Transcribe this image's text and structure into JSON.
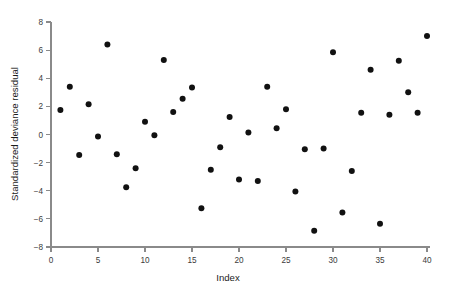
{
  "chart_data": {
    "type": "scatter",
    "title": "",
    "xlabel": "Index",
    "ylabel": "Standardized deviance residual",
    "xlim": [
      0,
      40
    ],
    "ylim": [
      -8,
      8
    ],
    "xticks": [
      0,
      5,
      10,
      15,
      20,
      25,
      30,
      35,
      40
    ],
    "xticklabels": [
      "0",
      "5",
      "10",
      "15",
      "20",
      "25",
      "30",
      "35",
      "40"
    ],
    "yticks": [
      -8,
      -6,
      -4,
      -2,
      0,
      2,
      4,
      6,
      8
    ],
    "yticklabels": [
      "-8",
      "-6",
      "-4",
      "-2",
      "0",
      "2",
      "4",
      "6",
      "8"
    ],
    "grid": false,
    "legend": null,
    "marker": "filled-circle",
    "marker_color": "#111111",
    "marker_size": 3.0,
    "x": [
      1,
      2,
      3,
      4,
      5,
      6,
      7,
      8,
      9,
      10,
      11,
      12,
      13,
      14,
      15,
      16,
      17,
      18,
      19,
      20,
      21,
      22,
      23,
      24,
      25,
      26,
      27,
      28,
      29,
      30,
      31,
      32,
      33,
      34,
      35,
      36,
      37,
      38,
      39,
      40
    ],
    "y": [
      1.75,
      3.4,
      -1.45,
      2.15,
      -0.15,
      6.4,
      -1.4,
      -3.75,
      -2.4,
      0.9,
      -0.05,
      5.3,
      1.6,
      2.55,
      3.35,
      -5.25,
      -2.5,
      -0.9,
      1.25,
      -3.2,
      0.15,
      -3.3,
      3.4,
      0.45,
      1.8,
      -4.05,
      -1.05,
      -6.85,
      -1.0,
      5.85,
      -5.55,
      -2.6,
      1.55,
      4.6,
      -6.35,
      1.4,
      5.25,
      3.0,
      1.55,
      7.0
    ],
    "points": [
      {
        "index": 1,
        "residual": 1.75
      },
      {
        "index": 2,
        "residual": 3.4
      },
      {
        "index": 3,
        "residual": -1.45
      },
      {
        "index": 4,
        "residual": 2.15
      },
      {
        "index": 5,
        "residual": -0.15
      },
      {
        "index": 6,
        "residual": 6.4
      },
      {
        "index": 7,
        "residual": -1.4
      },
      {
        "index": 8,
        "residual": -3.75
      },
      {
        "index": 9,
        "residual": -2.4
      },
      {
        "index": 10,
        "residual": 0.9
      },
      {
        "index": 11,
        "residual": -0.05
      },
      {
        "index": 12,
        "residual": 5.3
      },
      {
        "index": 13,
        "residual": 1.6
      },
      {
        "index": 14,
        "residual": 2.55
      },
      {
        "index": 15,
        "residual": 3.35
      },
      {
        "index": 16,
        "residual": -5.25
      },
      {
        "index": 17,
        "residual": -2.5
      },
      {
        "index": 18,
        "residual": -0.9
      },
      {
        "index": 19,
        "residual": 1.25
      },
      {
        "index": 20,
        "residual": -3.2
      },
      {
        "index": 21,
        "residual": 0.15
      },
      {
        "index": 22,
        "residual": -3.3
      },
      {
        "index": 23,
        "residual": 3.4
      },
      {
        "index": 24,
        "residual": 0.45
      },
      {
        "index": 25,
        "residual": 1.8
      },
      {
        "index": 26,
        "residual": -4.05
      },
      {
        "index": 27,
        "residual": -1.05
      },
      {
        "index": 28,
        "residual": -6.85
      },
      {
        "index": 29,
        "residual": -1.0
      },
      {
        "index": 30,
        "residual": 5.85
      },
      {
        "index": 31,
        "residual": -5.55
      },
      {
        "index": 32,
        "residual": -2.6
      },
      {
        "index": 33,
        "residual": 1.55
      },
      {
        "index": 34,
        "residual": 4.6
      },
      {
        "index": 35,
        "residual": -6.35
      },
      {
        "index": 36,
        "residual": 1.4
      },
      {
        "index": 37,
        "residual": 5.25
      },
      {
        "index": 38,
        "residual": 3.0
      },
      {
        "index": 39,
        "residual": 1.55
      },
      {
        "index": 40,
        "residual": 7.0
      }
    ]
  },
  "colors": {
    "background": "#ffffff",
    "axis": "#8a8a8a",
    "tick_label": "#3a3a3a",
    "axis_title": "#1c1c1c",
    "marker": "#111111"
  }
}
